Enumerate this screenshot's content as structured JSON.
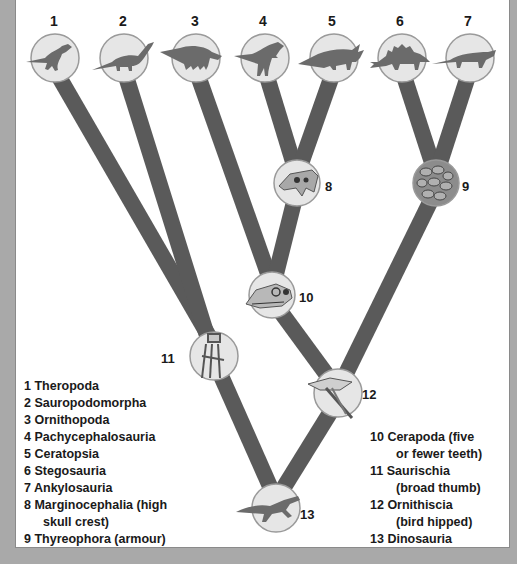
{
  "diagram": {
    "type": "cladogram",
    "colors": {
      "branch": "#5a5a5a",
      "node_fill": "#e6e6e6",
      "node_stroke": "#9a9a9a",
      "silhouette": "#6b6b6b",
      "background": "#ffffff",
      "frame": "#a9a9a9"
    },
    "top_labels": [
      "1",
      "2",
      "3",
      "4",
      "5",
      "6",
      "7"
    ],
    "node_labels": {
      "n8": "8",
      "n9": "9",
      "n10": "10",
      "n11": "11",
      "n12": "12",
      "n13": "13"
    },
    "icons": {
      "t1": "theropod-silhouette",
      "t2": "sauropod-silhouette",
      "t3": "ornithopod-silhouette",
      "t4": "pachycephalosaur-silhouette",
      "t5": "ceratopsian-silhouette",
      "t6": "stegosaur-silhouette",
      "t7": "ankylosaur-silhouette",
      "n8": "skull-crest",
      "n9": "armour-scutes",
      "n10": "skull-teeth",
      "n11": "hand-broad-thumb",
      "n12": "bird-hip-pelvis",
      "n13": "early-dinosaur-silhouette"
    }
  },
  "legend_left": [
    {
      "num": "1",
      "text": "Theropoda"
    },
    {
      "num": "2",
      "text": "Sauropodomorpha"
    },
    {
      "num": "3",
      "text": "Ornithopoda"
    },
    {
      "num": "4",
      "text": "Pachycephalosauria"
    },
    {
      "num": "5",
      "text": "Ceratopsia"
    },
    {
      "num": "6",
      "text": "Stegosauria"
    },
    {
      "num": "7",
      "text": "Ankylosauria"
    },
    {
      "num": "8",
      "text": "Marginocephalia (high",
      "cont": "skull crest)"
    },
    {
      "num": "9",
      "text": "Thyreophora (armour)"
    }
  ],
  "legend_right": [
    {
      "num": "10",
      "text": "Cerapoda (five",
      "cont": "or fewer teeth)"
    },
    {
      "num": "11",
      "text": "Saurischia",
      "cont": "(broad thumb)"
    },
    {
      "num": "12",
      "text": "Ornithiscia",
      "cont": "(bird hipped)"
    },
    {
      "num": "13",
      "text": "Dinosauria"
    }
  ]
}
